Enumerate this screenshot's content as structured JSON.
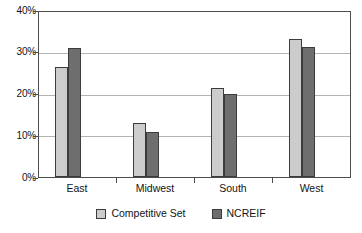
{
  "chart_data": {
    "type": "bar",
    "title": "",
    "xlabel": "",
    "ylabel": "",
    "categories": [
      "East",
      "Midwest",
      "South",
      "West"
    ],
    "series": [
      {
        "name": "Competitive Set",
        "color": "#cccccc",
        "values": [
          26.7,
          13.2,
          21.5,
          33.5
        ]
      },
      {
        "name": "NCREIF",
        "color": "#6e6e6e",
        "values": [
          31.3,
          10.8,
          20.2,
          31.5
        ]
      }
    ],
    "ylim": [
      0,
      40
    ],
    "y_ticks": [
      0,
      10,
      20,
      30,
      40
    ],
    "y_tick_labels": [
      "0%",
      "10%",
      "20%",
      "30%",
      "40%"
    ],
    "grid": true,
    "grid_axis": "y",
    "legend_position": "bottom",
    "value_format": "percent",
    "frame_color": "#4d4d4d",
    "gridline_color": "#b4b4b4",
    "bar_edge_color": "#3c3c3c",
    "background": "#ffffff"
  }
}
